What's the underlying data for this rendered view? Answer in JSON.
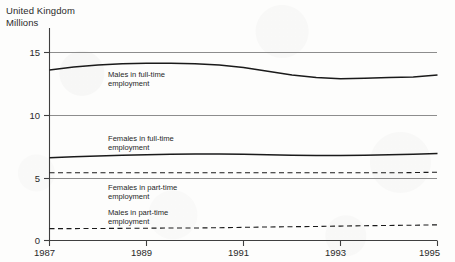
{
  "header": {
    "country": "United Kingdom",
    "units": "Millions"
  },
  "axis": {
    "y_ticks": [
      "0",
      "5",
      "10",
      "15"
    ],
    "x_ticks": [
      "1987",
      "1989",
      "1991",
      "1993",
      "1995"
    ]
  },
  "labels": {
    "males_full_time": "Males in full-time\nemployment",
    "males_full_time_line1": "Males in full-time",
    "males_full_time_line2": "employment",
    "females_full_time_line1": "Females in full-time",
    "females_full_time_line2": "employment",
    "females_part_time_line1": "Females in part-time",
    "females_part_time_line2": "employment",
    "males_part_time_line1": "Males in part-time",
    "males_part_time_line2": "employment"
  },
  "colors": {
    "ink": "#1a1a1a",
    "grid": "#8d8d8d",
    "axis": "#4a4a4a",
    "paper": "#fdfdfc"
  },
  "chart_data": {
    "type": "line",
    "title": "United Kingdom",
    "subtitle": "Millions",
    "xlabel": "",
    "ylabel": "Millions",
    "xlim": [
      1987,
      1995
    ],
    "ylim": [
      0,
      16.2
    ],
    "ytick_values": [
      0,
      5,
      10,
      15
    ],
    "xtick_values": [
      1987,
      1989,
      1991,
      1993,
      1995
    ],
    "grid": true,
    "grid_axis": "y",
    "legend": "inline-annotations",
    "x": [
      1987,
      1987.5,
      1988,
      1988.5,
      1989,
      1989.5,
      1990,
      1990.5,
      1991,
      1991.5,
      1992,
      1992.5,
      1993,
      1993.5,
      1994,
      1994.5,
      1995
    ],
    "series": [
      {
        "name": "Males in full-time employment",
        "style": "solid",
        "values": [
          13.6,
          13.85,
          14.0,
          14.1,
          14.15,
          14.15,
          14.1,
          14.0,
          13.8,
          13.5,
          13.2,
          13.0,
          12.9,
          12.95,
          13.0,
          13.05,
          13.2
        ]
      },
      {
        "name": "Females in full-time employment",
        "style": "solid",
        "values": [
          6.6,
          6.68,
          6.75,
          6.8,
          6.85,
          6.88,
          6.9,
          6.9,
          6.88,
          6.85,
          6.8,
          6.78,
          6.78,
          6.8,
          6.85,
          6.88,
          6.95
        ]
      },
      {
        "name": "Females in part-time employment",
        "style": "dashed",
        "values": [
          5.4,
          5.4,
          5.4,
          5.4,
          5.4,
          5.4,
          5.4,
          5.4,
          5.4,
          5.4,
          5.4,
          5.4,
          5.4,
          5.4,
          5.4,
          5.42,
          5.45
        ]
      },
      {
        "name": "Males in part-time employment",
        "style": "dashed",
        "values": [
          0.95,
          0.95,
          0.96,
          0.97,
          0.98,
          1.0,
          1.0,
          1.02,
          1.05,
          1.08,
          1.1,
          1.12,
          1.15,
          1.18,
          1.2,
          1.22,
          1.25
        ]
      }
    ]
  }
}
